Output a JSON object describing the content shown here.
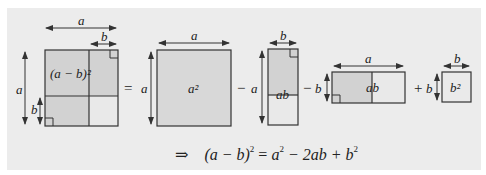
{
  "diagram": {
    "colors": {
      "background": "#ffffff",
      "panel": "#ececec",
      "shaded": "#d2d2d2",
      "light": "#e9e9e9",
      "stroke": "#333333"
    },
    "figure1": {
      "top_label": "a",
      "inner_top_label": "b",
      "left_label": "a",
      "inner_left_label": "b",
      "region_label": "(a − b)²"
    },
    "operators": [
      "=",
      "−",
      "−",
      "+"
    ],
    "figure2": {
      "top_label": "a",
      "left_label": "a",
      "region_label": "a²"
    },
    "figure3": {
      "top_label": "b",
      "left_label": "a",
      "region_label": "ab"
    },
    "figure4": {
      "top_label": "a",
      "left_label": "b",
      "region_label": "ab"
    },
    "figure5": {
      "top_label": "b",
      "left_label": "b",
      "region_label": "b²"
    },
    "formula": {
      "arrow": "⇒",
      "lhs": "(a − b)",
      "lhs_exp": "2",
      "eq": " = ",
      "a": "a",
      "a_exp": "2",
      "middle": " − 2ab + ",
      "b": "b",
      "b_exp": "2"
    }
  }
}
